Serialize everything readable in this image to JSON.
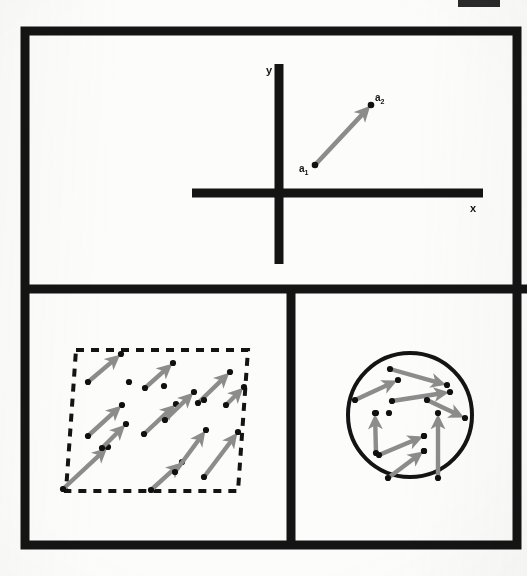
{
  "figure": {
    "background_color": "#fcfcfb",
    "ink_color": "#141414",
    "vector_color": "#8c8c8c",
    "point_color": "#101010",
    "frame": {
      "x": 25,
      "y": 31,
      "width": 492,
      "height": 514,
      "stroke_width": 9
    },
    "dividers": {
      "horizontal_y": 289,
      "vertical_x": 291
    },
    "top_edge_mark": {
      "x": 458,
      "y": 0,
      "width": 42,
      "height": 7,
      "color": "#2a2a2a"
    }
  },
  "panels": [
    {
      "id": "panel-axes",
      "name": "coordinate-axes-panel",
      "caption": "",
      "axes": {
        "origin": {
          "x": 279,
          "y": 193
        },
        "x_axis": {
          "x1": 192,
          "y1": 193,
          "x2": 483,
          "y2": 193,
          "stroke_width": 9
        },
        "y_axis": {
          "x1": 279,
          "y1": 64,
          "x2": 279,
          "y2": 264,
          "stroke_width": 9
        },
        "x_label": {
          "text": "x",
          "x": 470,
          "y": 212
        },
        "y_label": {
          "text": "y",
          "x": 266,
          "y": 74
        }
      },
      "vectors": [
        {
          "from": {
            "x": 315,
            "y": 165
          },
          "to": {
            "x": 371,
            "y": 105
          },
          "tail_label": {
            "base": "a",
            "sub": "1",
            "x": 299,
            "y": 172
          },
          "head_label": {
            "base": "a",
            "sub": "2",
            "x": 375,
            "y": 101
          }
        }
      ]
    },
    {
      "id": "panel-parallelogram",
      "name": "uniform-vector-field-panel",
      "caption": "",
      "region": {
        "shape": "parallelogram",
        "stroke": "dashed",
        "dash": "8 7",
        "stroke_width": 4,
        "points": [
          {
            "x": 76,
            "y": 350
          },
          {
            "x": 248,
            "y": 350
          },
          {
            "x": 241,
            "y": 491
          },
          {
            "x": 68,
            "y": 491
          }
        ],
        "skew_points": [
          {
            "x": 76,
            "y": 350
          },
          {
            "x": 248,
            "y": 350
          },
          {
            "x": 238,
            "y": 491
          },
          {
            "x": 66,
            "y": 491
          }
        ]
      },
      "vectors": [
        {
          "from": {
            "x": 88,
            "y": 382
          },
          "to": {
            "x": 121,
            "y": 354
          }
        },
        {
          "from": {
            "x": 88,
            "y": 436
          },
          "to": {
            "x": 122,
            "y": 405
          }
        },
        {
          "from": {
            "x": 63,
            "y": 489
          },
          "to": {
            "x": 108,
            "y": 447
          }
        },
        {
          "from": {
            "x": 144,
            "y": 434
          },
          "to": {
            "x": 176,
            "y": 404
          }
        },
        {
          "from": {
            "x": 145,
            "y": 388
          },
          "to": {
            "x": 173,
            "y": 363
          }
        },
        {
          "from": {
            "x": 165,
            "y": 420
          },
          "to": {
            "x": 194,
            "y": 392
          }
        },
        {
          "from": {
            "x": 198,
            "y": 403
          },
          "to": {
            "x": 230,
            "y": 372
          }
        },
        {
          "from": {
            "x": 151,
            "y": 490
          },
          "to": {
            "x": 182,
            "y": 462
          }
        },
        {
          "from": {
            "x": 175,
            "y": 472
          },
          "to": {
            "x": 206,
            "y": 430
          }
        },
        {
          "from": {
            "x": 204,
            "y": 477
          },
          "to": {
            "x": 238,
            "y": 432
          }
        },
        {
          "from": {
            "x": 102,
            "y": 448
          },
          "to": {
            "x": 126,
            "y": 424
          }
        },
        {
          "from": {
            "x": 226,
            "y": 405
          },
          "to": {
            "x": 244,
            "y": 387
          }
        }
      ],
      "extra_points": [
        {
          "x": 129,
          "y": 382
        },
        {
          "x": 164,
          "y": 386
        },
        {
          "x": 204,
          "y": 400
        }
      ]
    },
    {
      "id": "panel-circle",
      "name": "varied-vector-field-panel",
      "caption": "",
      "region": {
        "shape": "circle",
        "stroke": "solid",
        "stroke_width": 4,
        "center": {
          "x": 410,
          "y": 415
        },
        "radius": 62
      },
      "vectors": [
        {
          "from": {
            "x": 390,
            "y": 369
          },
          "to": {
            "x": 447,
            "y": 385
          }
        },
        {
          "from": {
            "x": 355,
            "y": 400
          },
          "to": {
            "x": 398,
            "y": 380
          }
        },
        {
          "from": {
            "x": 392,
            "y": 401
          },
          "to": {
            "x": 450,
            "y": 392
          }
        },
        {
          "from": {
            "x": 427,
            "y": 400
          },
          "to": {
            "x": 465,
            "y": 418
          }
        },
        {
          "from": {
            "x": 376,
            "y": 453
          },
          "to": {
            "x": 375,
            "y": 413
          }
        },
        {
          "from": {
            "x": 379,
            "y": 455
          },
          "to": {
            "x": 424,
            "y": 436
          }
        },
        {
          "from": {
            "x": 388,
            "y": 478
          },
          "to": {
            "x": 424,
            "y": 451
          }
        },
        {
          "from": {
            "x": 438,
            "y": 478
          },
          "to": {
            "x": 438,
            "y": 413
          }
        }
      ],
      "extra_points": [
        {
          "x": 376,
          "y": 413
        },
        {
          "x": 389,
          "y": 413
        },
        {
          "x": 424,
          "y": 436
        },
        {
          "x": 424,
          "y": 451
        }
      ]
    }
  ],
  "chart_data": {
    "type": "scatter",
    "xlabel": "x",
    "ylabel": "y",
    "grid": false,
    "legend": null,
    "annotations": [
      "a1",
      "a2",
      "x",
      "y"
    ],
    "series": [
      {
        "name": "single displacement vector",
        "panel": "panel-axes",
        "arrows": [
          {
            "tail": [
              315,
              165
            ],
            "head": [
              371,
              105
            ],
            "tail_label": "a1",
            "head_label": "a2"
          }
        ]
      },
      {
        "name": "uniform parallel vectors in parallelogram",
        "panel": "panel-parallelogram",
        "count": 12,
        "direction_deg": 42,
        "uniform": true
      },
      {
        "name": "varied vectors in disc",
        "panel": "panel-circle",
        "count": 8,
        "uniform": false
      }
    ]
  }
}
